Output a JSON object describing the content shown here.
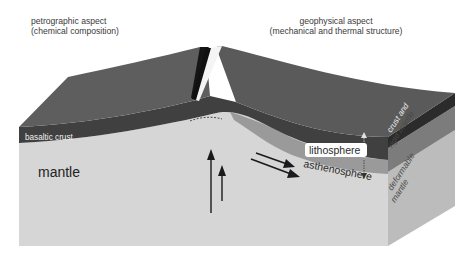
{
  "headers": {
    "left": {
      "title": "petrographic aspect",
      "subtitle": "(chemical composition)"
    },
    "right": {
      "title": "geophysical aspect",
      "subtitle": "(mechanical and thermal structure)"
    }
  },
  "labels": {
    "basaltic_crust": "basaltic crust",
    "mantle": "mantle",
    "lithosphere": "lithosphere",
    "asthenosphere": "asthenosphere",
    "crust_and_rigid_mantle_line1": "crust and",
    "crust_and_rigid_mantle_line2": "rigid mantle",
    "deformable_mantle_line1": "deformable",
    "deformable_mantle_line2": "mantle"
  },
  "colors": {
    "background": "#ffffff",
    "crust_top": "#5a5a5a",
    "crust_front": "#3f3f3f",
    "crust_side": "#2e2e2e",
    "lithosphere_mantle": "#8e8e8e",
    "lithosphere_side": "#7a7a7a",
    "mantle_front": "#d4d4d4",
    "mantle_side": "#bdbdbd",
    "arrow": "#1a1a1a",
    "text_dark": "#2a2a2a",
    "text_light": "#f2f2f2"
  },
  "icons": {
    "upwelling_arrows": "arrow-up",
    "flow_arrows": "arrow-right-down",
    "thickness_indicator": "double-headed-dashed-arrow"
  }
}
